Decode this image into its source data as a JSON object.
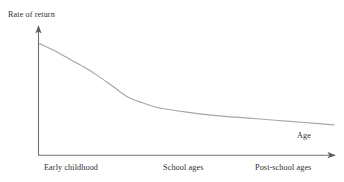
{
  "figure": {
    "background_color": "#ffffff",
    "axis_color": "#6f6f72",
    "curve_color": "#a6a6a6",
    "text_color": "#2e2e2e"
  },
  "axes": {
    "y_label": "Rate of return",
    "x_label": "Age",
    "y_arrow": "arrow-up",
    "x_arrow": "arrow-right"
  },
  "categories": {
    "early": "Early childhood",
    "school": "School ages",
    "post": "Post-school ages"
  },
  "chart_data": {
    "type": "line",
    "title": "",
    "subtitle": "",
    "xlabel": "Age",
    "ylabel": "Rate of return",
    "grid": false,
    "legend": "none",
    "axis_style": "arrow-headed, unlabeled magnitude axes",
    "xlim": [
      0,
      1
    ],
    "ylim": [
      0,
      1
    ],
    "x_tick_labels": [
      "Early childhood",
      "School ages",
      "Post-school ages"
    ],
    "y_tick_labels": [],
    "annotations": [],
    "series": [
      {
        "name": "Rate of return to investment in human capital",
        "description": "Monotonically decreasing convex curve: very high in early childhood, falling steeply, with a knee at school ages, then a near-flat gentle decline through post-school ages.",
        "x": [
          0.0,
          0.05,
          0.1,
          0.15,
          0.2,
          0.25,
          0.3,
          0.35,
          0.4,
          0.5,
          0.6,
          0.7,
          0.8,
          0.9,
          1.0
        ],
        "values": [
          0.96,
          0.9,
          0.83,
          0.76,
          0.68,
          0.59,
          0.5,
          0.45,
          0.41,
          0.37,
          0.34,
          0.32,
          0.3,
          0.28,
          0.26
        ]
      }
    ]
  }
}
